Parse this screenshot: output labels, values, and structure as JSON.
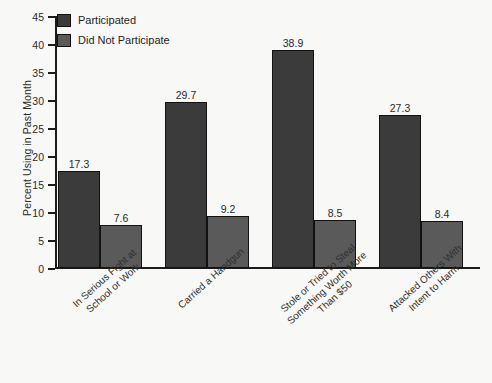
{
  "chart_data": {
    "type": "bar",
    "title": "",
    "xlabel": "",
    "ylabel": "Percent Using in Past Month",
    "ylim": [
      0,
      45
    ],
    "yticks": [
      0,
      5,
      10,
      15,
      20,
      25,
      30,
      35,
      40,
      45
    ],
    "grid": false,
    "legend_position": "top-left",
    "categories": [
      [
        "In Serious Fight at",
        "School or Work"
      ],
      [
        "Carried a Handgun"
      ],
      [
        "Stole or Tried to Steal",
        "Something Worth More",
        "Than $50"
      ],
      [
        "Attacked Others With",
        "Intent to Harm"
      ]
    ],
    "series": [
      {
        "name": "Participated",
        "color": "#3b3b3b",
        "values": [
          17.3,
          29.7,
          38.9,
          27.3
        ]
      },
      {
        "name": "Did Not Participate",
        "color": "#5a5a5a",
        "values": [
          7.6,
          9.2,
          8.5,
          8.4
        ]
      }
    ]
  }
}
